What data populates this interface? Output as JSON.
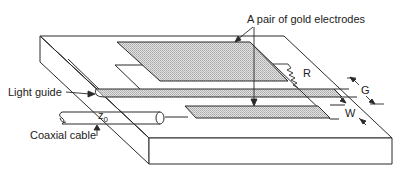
{
  "diagram": {
    "labels": {
      "electrodes": "A pair of gold electrodes",
      "resistor": "R",
      "gap": "G",
      "width": "W",
      "light_guide": "Light guide",
      "impedance": "z",
      "impedance_sub": "0",
      "coaxial_cable": "Coaxial cable"
    },
    "colors": {
      "line": "#2a2a2a",
      "electrode_fill": "#cfcfcf",
      "background": "#ffffff"
    }
  }
}
